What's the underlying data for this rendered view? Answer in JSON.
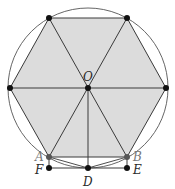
{
  "figure": {
    "type": "geometry-diagram",
    "colors": {
      "background": "#ffffff",
      "hexagon_fill": "#dcdcdc",
      "stroke": "#3a3a3a",
      "point": "#111111",
      "point_gray": "#555555"
    },
    "circle": {
      "center": "O",
      "cx": 88,
      "cy": 88,
      "r": 80
    },
    "points": [
      {
        "id": "O",
        "label": "O",
        "x": 88,
        "y": 88
      },
      {
        "id": "A",
        "label": "A",
        "x": 49,
        "y": 157
      },
      {
        "id": "B",
        "label": "B",
        "x": 127,
        "y": 157
      },
      {
        "id": "F",
        "label": "F",
        "x": 49,
        "y": 168
      },
      {
        "id": "E",
        "label": "E",
        "x": 127,
        "y": 168
      },
      {
        "id": "D",
        "label": "D",
        "x": 88,
        "y": 168
      },
      {
        "id": "V1",
        "label": "",
        "x": 49,
        "y": 18
      },
      {
        "id": "V2",
        "label": "",
        "x": 127,
        "y": 18
      },
      {
        "id": "V3",
        "label": "",
        "x": 166,
        "y": 88
      },
      {
        "id": "V6",
        "label": "",
        "x": 10,
        "y": 88
      }
    ],
    "labels": {
      "O": "O",
      "A": "A",
      "B": "B",
      "F": "F",
      "E": "E",
      "D": "D"
    },
    "segments": [
      [
        "V1",
        "V2"
      ],
      [
        "V2",
        "V3"
      ],
      [
        "V3",
        "B"
      ],
      [
        "B",
        "A"
      ],
      [
        "A",
        "V6"
      ],
      [
        "V6",
        "V1"
      ],
      [
        "V1",
        "B"
      ],
      [
        "V2",
        "A"
      ],
      [
        "V6",
        "V3"
      ],
      [
        "O",
        "D"
      ],
      [
        "A",
        "F"
      ],
      [
        "B",
        "E"
      ],
      [
        "F",
        "E"
      ],
      [
        "A",
        "D"
      ],
      [
        "D",
        "B"
      ]
    ]
  }
}
